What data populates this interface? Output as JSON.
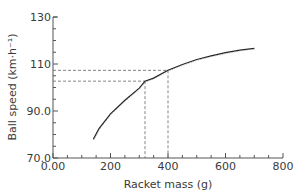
{
  "chart_data": {
    "type": "line",
    "title": "",
    "xlabel": "Racket mass (g)",
    "ylabel": "Ball speed (km·h⁻¹)",
    "xlim": [
      0,
      800
    ],
    "ylim": [
      70,
      130
    ],
    "x_ticks": [
      "0.00",
      "200",
      "400",
      "600",
      "800"
    ],
    "x_tick_values": [
      0,
      200,
      400,
      600,
      800
    ],
    "y_ticks": [
      "70.0",
      "90.0",
      "110",
      "130"
    ],
    "y_tick_values": [
      70,
      90,
      110,
      130
    ],
    "grid": false,
    "series": [
      {
        "name": "ball speed",
        "x": [
          140,
          160,
          200,
          250,
          300,
          320,
          350,
          400,
          450,
          500,
          550,
          600,
          650,
          700
        ],
        "y": [
          78.0,
          82.5,
          88.8,
          94.6,
          99.7,
          102.7,
          104.0,
          107.3,
          109.8,
          111.9,
          113.5,
          114.8,
          115.9,
          116.7
        ]
      }
    ],
    "annotations": [
      {
        "type": "dashed-guide",
        "x": 320,
        "y": 102.7
      },
      {
        "type": "dashed-guide",
        "x": 400,
        "y": 107.3
      }
    ]
  }
}
